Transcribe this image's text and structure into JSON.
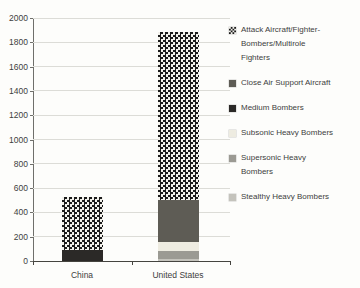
{
  "chart_data": {
    "type": "bar",
    "stacked": true,
    "title": "",
    "categories": [
      "China",
      "United States"
    ],
    "series": [
      {
        "name": "Stealthy Heavy Bombers",
        "values": [
          0,
          20
        ],
        "color": "#c4c3bc",
        "pattern": "solid"
      },
      {
        "name": "Supersonic Heavy Bombers",
        "values": [
          0,
          65
        ],
        "color": "#9b9a93",
        "pattern": "solid"
      },
      {
        "name": "Subsonic Heavy Bombers",
        "values": [
          0,
          70
        ],
        "color": "#eeece1",
        "pattern": "solid"
      },
      {
        "name": "Medium Bombers",
        "values": [
          90,
          0
        ],
        "color": "#2b2927",
        "pattern": "solid"
      },
      {
        "name": "Close Air Support Aircraft",
        "values": [
          0,
          345
        ],
        "color": "#5e5c55",
        "pattern": "solid"
      },
      {
        "name": "Attack Aircraft/Fighter-Bombers/Multirole Fighters",
        "values": [
          440,
          1385
        ],
        "color": "#1b1b1b",
        "pattern": "checker"
      }
    ],
    "totals": {
      "China": 530,
      "United States": 1885
    },
    "ylim": [
      0,
      2000
    ],
    "ytick_step": 200,
    "grid": true,
    "legend_position": "right",
    "legend": [
      {
        "series_index": 5,
        "label_lines": [
          "Attack Aircraft/Fighter-",
          "Bombers/Multirole",
          "Fighters"
        ]
      },
      {
        "series_index": 4,
        "label_lines": [
          "Close Air Support Aircraft"
        ]
      },
      {
        "series_index": 3,
        "label_lines": [
          "Medium Bombers"
        ]
      },
      {
        "series_index": 2,
        "label_lines": [
          "Subsonic Heavy Bombers"
        ]
      },
      {
        "series_index": 1,
        "label_lines": [
          "Supersonic Heavy",
          "Bombers"
        ]
      },
      {
        "series_index": 0,
        "label_lines": [
          "Stealthy Heavy Bombers"
        ]
      }
    ]
  }
}
